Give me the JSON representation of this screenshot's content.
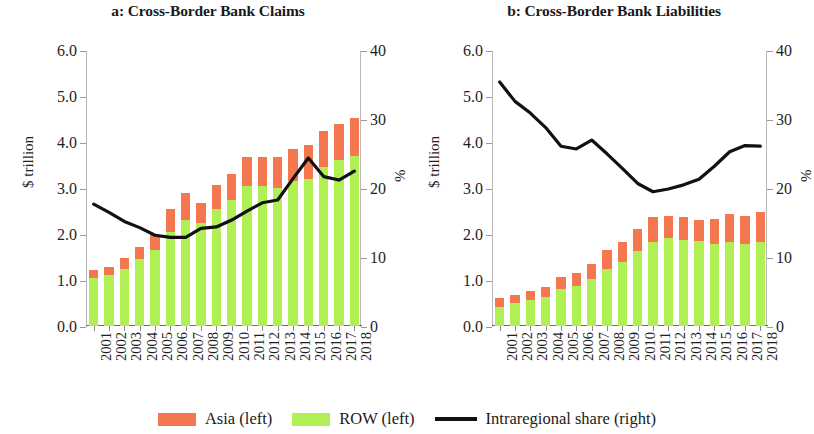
{
  "figure": {
    "background": "#ffffff"
  },
  "legend": {
    "items": [
      {
        "key": "asia",
        "label": "Asia (left)",
        "type": "swatch",
        "color": "#f4774f"
      },
      {
        "key": "row",
        "label": "ROW (left)",
        "type": "swatch",
        "color": "#b0f055"
      },
      {
        "key": "share",
        "label": "Intraregional share (right)",
        "type": "line",
        "color": "#111111"
      }
    ]
  },
  "colors": {
    "asia": "#f4774f",
    "row": "#b0f055",
    "line": "#111111",
    "axis": "#b8b8b8",
    "text": "#1a1a1a"
  },
  "chart_data": [
    {
      "id": "panel-a",
      "type": "bar",
      "title": "a: Cross-Border Bank Claims",
      "xlabel": "",
      "ylabel": "$ trillion",
      "y2label": "%",
      "categories": [
        "2001",
        "2002",
        "2003",
        "2004",
        "2005",
        "2006",
        "2007",
        "2008",
        "2009",
        "2010",
        "2011",
        "2012",
        "2013",
        "2014",
        "2015",
        "2016",
        "2017",
        "2018"
      ],
      "ylim": [
        0,
        6
      ],
      "yticks": [
        "0.0",
        "1.0",
        "2.0",
        "3.0",
        "4.0",
        "5.0",
        "6.0"
      ],
      "ytick_values": [
        0,
        1,
        2,
        3,
        4,
        5,
        6
      ],
      "y2lim": [
        0,
        40
      ],
      "y2ticks": [
        "0",
        "10",
        "20",
        "30",
        "40"
      ],
      "y2tick_values": [
        0,
        10,
        20,
        30,
        40
      ],
      "grid": false,
      "legend_position": "bottom",
      "series": [
        {
          "name": "ROW (left)",
          "axis": "left",
          "color": "#b0f055",
          "stack": "total",
          "values": [
            1.05,
            1.1,
            1.25,
            1.45,
            1.65,
            2.05,
            2.3,
            2.25,
            2.55,
            2.75,
            3.05,
            3.05,
            3.0,
            3.15,
            3.2,
            3.45,
            3.6,
            3.7
          ]
        },
        {
          "name": "Asia (left)",
          "axis": "left",
          "color": "#f4774f",
          "stack": "total",
          "values": [
            0.17,
            0.18,
            0.22,
            0.26,
            0.33,
            0.5,
            0.6,
            0.42,
            0.52,
            0.55,
            0.62,
            0.63,
            0.67,
            0.7,
            0.73,
            0.78,
            0.8,
            0.83
          ]
        },
        {
          "name": "Intraregional share (right)",
          "axis": "right",
          "color": "#111111",
          "type": "line",
          "values": [
            17.8,
            16.6,
            15.3,
            14.4,
            13.3,
            13.0,
            13.0,
            14.3,
            14.5,
            15.5,
            16.8,
            18.0,
            18.4,
            21.5,
            24.5,
            21.8,
            21.3,
            22.6
          ]
        }
      ],
      "series_line_display": [
        17.8,
        16.6,
        15.3,
        14.4,
        13.3,
        13.0,
        13.0,
        14.3,
        14.5,
        15.5,
        16.8,
        18.0,
        18.4,
        21.5,
        24.5,
        21.8,
        21.3,
        22.6
      ]
    },
    {
      "id": "panel-b",
      "type": "bar",
      "title": "b: Cross-Border Bank Liabilities",
      "xlabel": "",
      "ylabel": "$ trillion",
      "y2label": "%",
      "categories": [
        "2001",
        "2002",
        "2003",
        "2004",
        "2005",
        "2006",
        "2007",
        "2008",
        "2009",
        "2010",
        "2011",
        "2012",
        "2013",
        "2014",
        "2015",
        "2016",
        "2017",
        "2018"
      ],
      "ylim": [
        0,
        6
      ],
      "yticks": [
        "0.0",
        "1.0",
        "2.0",
        "3.0",
        "4.0",
        "5.0",
        "6.0"
      ],
      "ytick_values": [
        0,
        1,
        2,
        3,
        4,
        5,
        6
      ],
      "y2lim": [
        0,
        40
      ],
      "y2ticks": [
        "0",
        "10",
        "20",
        "30",
        "40"
      ],
      "y2tick_values": [
        0,
        10,
        20,
        30,
        40
      ],
      "grid": false,
      "legend_position": "bottom",
      "series": [
        {
          "name": "ROW (left)",
          "axis": "left",
          "color": "#b0f055",
          "stack": "total",
          "values": [
            0.42,
            0.5,
            0.56,
            0.63,
            0.8,
            0.87,
            1.02,
            1.25,
            1.4,
            1.63,
            1.83,
            1.92,
            1.88,
            1.85,
            1.78,
            1.82,
            1.78,
            1.83
          ]
        },
        {
          "name": "Asia (left)",
          "axis": "left",
          "color": "#f4774f",
          "stack": "total",
          "values": [
            0.18,
            0.18,
            0.2,
            0.22,
            0.27,
            0.29,
            0.33,
            0.4,
            0.42,
            0.47,
            0.53,
            0.47,
            0.5,
            0.46,
            0.55,
            0.62,
            0.62,
            0.65
          ]
        },
        {
          "name": "Intraregional share (right)",
          "axis": "right",
          "color": "#111111",
          "type": "line",
          "values": [
            35.5,
            32.7,
            31.0,
            28.9,
            26.2,
            25.8,
            27.1,
            25.1,
            23.0,
            20.8,
            19.6,
            20.0,
            20.6,
            21.4,
            23.3,
            25.4,
            26.3,
            26.2
          ]
        },
        {
          "name": "Intraregional share (right)",
          "axis": "right",
          "color": "#111111",
          "type": "line",
          "values_display": [
            35.5,
            32.7,
            31.0,
            28.9,
            26.2,
            25.8,
            27.1,
            25.1,
            23.0,
            20.8,
            19.6,
            20.0,
            20.6,
            21.4,
            23.3,
            25.4,
            26.3,
            26.2
          ]
        }
      ]
    }
  ]
}
